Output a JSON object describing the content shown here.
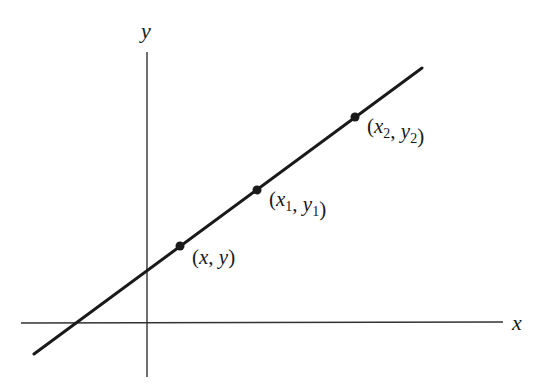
{
  "heading_fragment": "Figure",
  "diagram": {
    "type": "coordinate-line",
    "axes": {
      "x_label": "x",
      "y_label": "y",
      "origin_px": [
        147,
        323
      ],
      "x_axis_px": [
        [
          21,
          323
        ],
        [
          503,
          322
        ]
      ],
      "y_axis_px": [
        [
          147,
          52
        ],
        [
          147,
          377
        ]
      ]
    },
    "line": {
      "start_px": [
        34,
        354
      ],
      "end_px": [
        422,
        68
      ],
      "y_intercept_px": [
        147,
        272
      ],
      "x_intercept_px": [
        78,
        323
      ]
    },
    "points": [
      {
        "label": "(x, y)",
        "name": "point-x-y",
        "px": [
          180,
          246
        ],
        "label_px": [
          192,
          264
        ]
      },
      {
        "label": "(x1, y1)",
        "name": "point-x1-y1",
        "px": [
          257,
          190
        ],
        "label_px": [
          269,
          206
        ]
      },
      {
        "label": "(x2, y2)",
        "name": "point-x2-y2",
        "px": [
          355,
          117
        ],
        "label_px": [
          367,
          133
        ]
      }
    ],
    "colors": {
      "ink": "#1a1a1a",
      "axis": "#333333",
      "background": "#ffffff"
    }
  }
}
